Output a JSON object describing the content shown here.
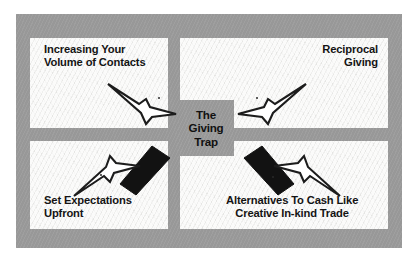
{
  "figure": {
    "title": "The Giving Trap",
    "center": {
      "lines": [
        "The",
        "Giving",
        "Trap"
      ],
      "background_color": "#9b9b9b",
      "text_color": "#111111"
    },
    "frame": {
      "background_color": "#9b9b9b",
      "panel_color": "#f1f1ef",
      "outer_background": "#ffffff"
    },
    "quadrants": [
      {
        "id": "top-left",
        "lines": [
          "Increasing Your",
          "Volume of Contacts"
        ],
        "align": "left",
        "connector": "white-arrow-pointing-down-right"
      },
      {
        "id": "top-right",
        "lines": [
          "Reciprocal",
          "Giving"
        ],
        "align": "right",
        "connector": "white-arrow-pointing-down-left"
      },
      {
        "id": "bottom-left",
        "lines": [
          "Set Expectations",
          "Upfront"
        ],
        "align": "left",
        "connector": "white-arrow-pointing-up-right-with-black-bar"
      },
      {
        "id": "bottom-right",
        "lines": [
          "Alternatives To Cash Like",
          "Creative In-kind Trade"
        ],
        "align": "center",
        "connector": "white-arrow-pointing-up-left-with-black-bar"
      }
    ]
  }
}
